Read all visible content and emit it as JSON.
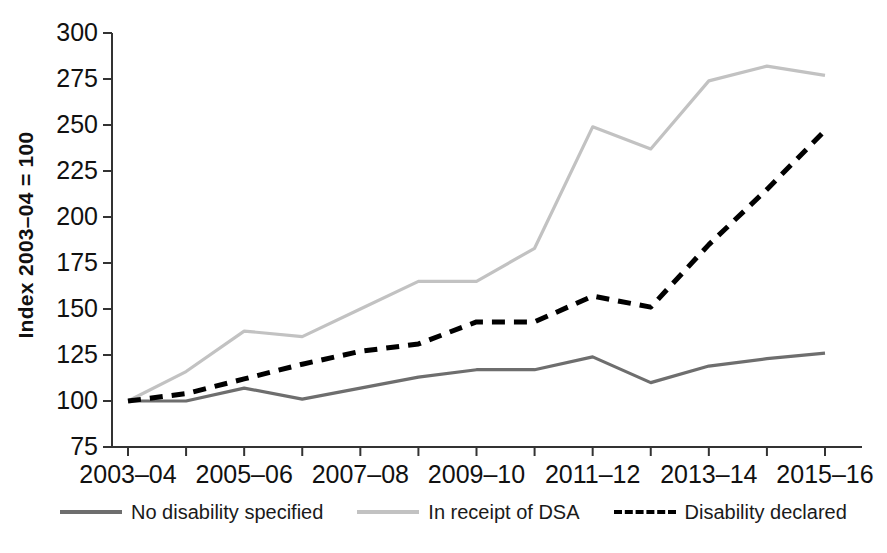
{
  "chart_data": {
    "type": "line",
    "title": "",
    "subtitle": "",
    "xlabel": "",
    "ylabel": "Index 2003–04 = 100",
    "ylim": [
      75,
      300
    ],
    "ytick_step": 25,
    "yticks": [
      "75",
      "100",
      "125",
      "150",
      "175",
      "200",
      "225",
      "250",
      "275",
      "300"
    ],
    "grid": false,
    "legend_position": "bottom",
    "x": [
      "2003–04",
      "2004–05",
      "2005–06",
      "2006–07",
      "2007–08",
      "2008–09",
      "2009–10",
      "2010–11",
      "2011–12",
      "2012–13",
      "2013–14",
      "2014–15",
      "2015–16"
    ],
    "xtick_labels": [
      "2003–04",
      "2005–06",
      "2007–08",
      "2009–10",
      "2011–12",
      "2013–14",
      "2015–16"
    ],
    "xtick_label_indices": [
      0,
      2,
      4,
      6,
      8,
      10,
      12
    ],
    "series": [
      {
        "name": "No disability specified",
        "style": "solid",
        "color": "#6e6e6e",
        "values": [
          100,
          100,
          107,
          101,
          107,
          113,
          117,
          117,
          124,
          110,
          119,
          123,
          126
        ]
      },
      {
        "name": "In receipt of DSA",
        "style": "solid",
        "color": "#c2c2c2",
        "values": [
          100,
          116,
          138,
          135,
          150,
          165,
          165,
          183,
          249,
          237,
          274,
          282,
          277
        ]
      },
      {
        "name": "Disability declared",
        "style": "dashed",
        "color": "#000000",
        "values": [
          100,
          104,
          112,
          120,
          127,
          131,
          143,
          143,
          157,
          151,
          185,
          215,
          247
        ]
      }
    ]
  },
  "axis": {
    "line_color": "#333333"
  },
  "legend": {
    "items": [
      {
        "label": "No disability specified"
      },
      {
        "label": "In receipt of DSA"
      },
      {
        "label": "Disability declared"
      }
    ]
  }
}
